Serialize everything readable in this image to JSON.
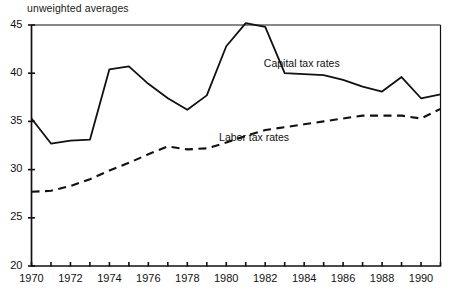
{
  "chart_data": {
    "type": "line",
    "title": "unweighted averages",
    "xlabel": "",
    "ylabel": "",
    "xlim": [
      1970,
      1991
    ],
    "ylim": [
      20,
      45
    ],
    "grid": false,
    "legend_position": "inline-annotation",
    "y_ticks": [
      20,
      25,
      30,
      35,
      40,
      45
    ],
    "x_ticks": [
      1970,
      1971,
      1972,
      1973,
      1974,
      1975,
      1976,
      1977,
      1978,
      1979,
      1980,
      1981,
      1982,
      1983,
      1984,
      1985,
      1986,
      1987,
      1988,
      1989,
      1990,
      1991
    ],
    "x_tick_labels": [
      "1970",
      "",
      "1972",
      "",
      "1974",
      "",
      "1976",
      "",
      "1978",
      "",
      "1980",
      "",
      "1982",
      "",
      "1984",
      "",
      "1986",
      "",
      "1988",
      "",
      "1990",
      ""
    ],
    "x": [
      1970,
      1971,
      1972,
      1973,
      1974,
      1975,
      1976,
      1977,
      1978,
      1979,
      1980,
      1981,
      1982,
      1983,
      1984,
      1985,
      1986,
      1987,
      1988,
      1989,
      1990,
      1991
    ],
    "series": [
      {
        "name": "Capital tax rates",
        "style": "solid",
        "color": "#111111",
        "values": [
          35.3,
          32.7,
          33.0,
          33.1,
          40.4,
          40.7,
          38.9,
          37.4,
          36.2,
          37.7,
          42.8,
          45.2,
          44.8,
          40.0,
          39.9,
          39.8,
          39.3,
          38.6,
          38.1,
          39.6,
          37.4,
          37.8
        ]
      },
      {
        "name": "Labor tax rates",
        "style": "dashed",
        "color": "#111111",
        "values": [
          27.7,
          27.8,
          28.3,
          29.0,
          29.9,
          30.7,
          31.6,
          32.4,
          32.1,
          32.2,
          32.8,
          33.5,
          34.1,
          34.4,
          34.7,
          35.0,
          35.3,
          35.6,
          35.6,
          35.6,
          35.3,
          36.3
        ]
      }
    ],
    "annotations": [
      {
        "text": "Capital tax rates",
        "x": 1984.6,
        "y": 41.0
      },
      {
        "text": "Labor tax rates",
        "x": 1982.3,
        "y": 33.3
      }
    ]
  }
}
